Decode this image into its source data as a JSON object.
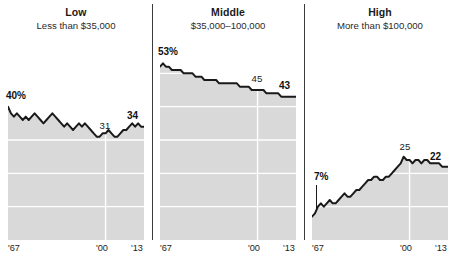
{
  "chart_data": {
    "type": "area",
    "title": "",
    "xlabel": "",
    "ylabel": "",
    "grid": true,
    "legend_position": "none",
    "xlim": [
      1967,
      2013
    ],
    "ylim": [
      0,
      60
    ],
    "x_ticks": [
      "'67",
      "'00",
      "'13"
    ],
    "x_tick_values": [
      1967,
      2000,
      2013
    ],
    "panels": [
      {
        "title": "Low",
        "subtitle": "Less than $35,000",
        "start_label": "40%",
        "mid_label": "31",
        "end_label": "34",
        "start_value": 40,
        "mid_value": 31,
        "end_value": 34,
        "values": [
          40,
          38,
          37,
          38,
          37,
          36,
          37,
          36,
          37,
          38,
          37,
          36,
          35,
          36,
          37,
          38,
          37,
          36,
          35,
          34,
          35,
          34,
          33,
          34,
          35,
          34,
          35,
          34,
          33,
          32,
          31,
          31,
          32,
          32,
          33,
          32,
          31,
          31,
          32,
          33,
          33,
          34,
          35,
          34,
          35,
          34,
          34
        ]
      },
      {
        "title": "Middle",
        "subtitle": "$35,000–100,000",
        "start_label": "53%",
        "mid_label": "45",
        "end_label": "43",
        "start_value": 53,
        "mid_value": 45,
        "end_value": 43,
        "values": [
          52,
          53,
          52,
          52,
          51,
          51,
          51,
          51,
          50,
          50,
          50,
          50,
          49,
          49,
          49,
          48,
          48,
          48,
          48,
          48,
          47,
          47,
          47,
          47,
          47,
          47,
          47,
          46,
          46,
          46,
          46,
          45,
          45,
          45,
          45,
          45,
          44,
          44,
          44,
          44,
          44,
          43,
          43,
          43,
          43,
          43,
          43
        ]
      },
      {
        "title": "High",
        "subtitle": "More than $100,000",
        "start_label": "7%",
        "mid_label": "25",
        "end_label": "22",
        "start_value": 7,
        "mid_value": 25,
        "end_value": 22,
        "values": [
          7,
          8,
          10,
          11,
          10,
          11,
          12,
          11,
          11,
          12,
          13,
          14,
          13,
          13,
          14,
          15,
          15,
          16,
          17,
          18,
          18,
          19,
          19,
          18,
          18,
          19,
          19,
          20,
          21,
          22,
          23,
          25,
          24,
          24,
          23,
          24,
          24,
          23,
          24,
          24,
          23,
          23,
          23,
          23,
          22,
          22,
          22
        ]
      }
    ]
  },
  "style": {
    "fill_color": "#d9d9d9",
    "line_color": "#1a1a1a",
    "grid_color": "#ffffff",
    "divider_color": "#3a3a3a",
    "background": "#ffffff"
  }
}
